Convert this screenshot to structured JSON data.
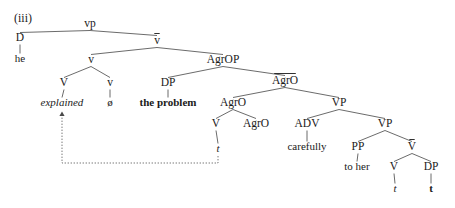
{
  "figure": {
    "example_number": "(iii)",
    "type": "syntax-tree",
    "sentence_reading": "he explained the problem carefully to her",
    "colors": {
      "text": "#1a1a1a",
      "branch": "#5a5a5a",
      "movement": "#6a6a6a",
      "background": "#ffffff"
    }
  },
  "nodes": [
    {
      "id": "vp",
      "label": "vp",
      "x": 90,
      "y": 27,
      "style": "plain",
      "bar": false
    },
    {
      "id": "D",
      "label": "D",
      "x": 20,
      "y": 41,
      "style": "plain",
      "bar": false
    },
    {
      "id": "he",
      "label": "he",
      "x": 20,
      "y": 62,
      "style": "plain",
      "bar": false,
      "terminal": true
    },
    {
      "id": "vbar",
      "label": "v",
      "x": 157,
      "y": 44,
      "style": "plain",
      "bar": true
    },
    {
      "id": "v2",
      "label": "v",
      "x": 91,
      "y": 63,
      "style": "plain",
      "bar": false
    },
    {
      "id": "V1",
      "label": "V",
      "x": 64,
      "y": 86,
      "style": "plain",
      "bar": false
    },
    {
      "id": "explained",
      "label": "explained",
      "x": 62,
      "y": 106,
      "style": "italic",
      "bar": false,
      "terminal": true
    },
    {
      "id": "v3",
      "label": "v",
      "x": 110,
      "y": 86,
      "style": "plain",
      "bar": false
    },
    {
      "id": "null",
      "label": "ø",
      "x": 110,
      "y": 106,
      "style": "plain",
      "bar": false,
      "terminal": true
    },
    {
      "id": "AgrOP",
      "label": "AgrOP",
      "x": 223,
      "y": 63,
      "style": "plain",
      "bar": false
    },
    {
      "id": "DP1",
      "label": "DP",
      "x": 168,
      "y": 86,
      "style": "plain",
      "bar": false
    },
    {
      "id": "problem",
      "label": "the problem",
      "x": 168,
      "y": 106,
      "style": "bold",
      "bar": false,
      "terminal": true
    },
    {
      "id": "AgrObar",
      "label": "AgrO",
      "x": 285,
      "y": 84,
      "style": "plain",
      "bar": true
    },
    {
      "id": "AgrO2",
      "label": "AgrO",
      "x": 233,
      "y": 106,
      "style": "plain",
      "bar": false
    },
    {
      "id": "V2",
      "label": "V",
      "x": 216,
      "y": 127,
      "style": "plain",
      "bar": false
    },
    {
      "id": "t1",
      "label": "t",
      "x": 218,
      "y": 152,
      "style": "italic",
      "bar": false,
      "terminal": true
    },
    {
      "id": "AgrO3",
      "label": "AgrO",
      "x": 256,
      "y": 127,
      "style": "plain",
      "bar": false
    },
    {
      "id": "VP1",
      "label": "VP",
      "x": 339,
      "y": 106,
      "style": "plain",
      "bar": false
    },
    {
      "id": "ADV",
      "label": "ADV",
      "x": 307,
      "y": 127,
      "style": "plain",
      "bar": false
    },
    {
      "id": "carefully",
      "label": "carefully",
      "x": 307,
      "y": 150,
      "style": "plain",
      "bar": false,
      "terminal": true
    },
    {
      "id": "VP2",
      "label": "VP",
      "x": 385,
      "y": 127,
      "style": "plain",
      "bar": false
    },
    {
      "id": "PP",
      "label": "PP",
      "x": 358,
      "y": 150,
      "style": "plain",
      "bar": false
    },
    {
      "id": "toher",
      "label": "to her",
      "x": 357,
      "y": 170,
      "style": "plain",
      "bar": false,
      "terminal": true
    },
    {
      "id": "Vbar2",
      "label": "V",
      "x": 412,
      "y": 150,
      "style": "plain",
      "bar": true
    },
    {
      "id": "V3",
      "label": "V",
      "x": 394,
      "y": 170,
      "style": "plain",
      "bar": false
    },
    {
      "id": "t2",
      "label": "t",
      "x": 395,
      "y": 192,
      "style": "italic",
      "bar": false,
      "terminal": true
    },
    {
      "id": "DP2",
      "label": "DP",
      "x": 431,
      "y": 170,
      "style": "plain",
      "bar": false
    },
    {
      "id": "t3",
      "label": "t",
      "x": 431,
      "y": 192,
      "style": "bold",
      "bar": false,
      "terminal": true
    }
  ],
  "edges": [
    {
      "from": "vp",
      "to": "D"
    },
    {
      "from": "vp",
      "to": "vbar"
    },
    {
      "from": "D",
      "to": "he"
    },
    {
      "from": "vbar",
      "to": "v2"
    },
    {
      "from": "vbar",
      "to": "AgrOP"
    },
    {
      "from": "v2",
      "to": "V1"
    },
    {
      "from": "v2",
      "to": "v3"
    },
    {
      "from": "V1",
      "to": "explained"
    },
    {
      "from": "v3",
      "to": "null"
    },
    {
      "from": "AgrOP",
      "to": "DP1"
    },
    {
      "from": "AgrOP",
      "to": "AgrObar"
    },
    {
      "from": "DP1",
      "to": "problem"
    },
    {
      "from": "AgrObar",
      "to": "AgrO2"
    },
    {
      "from": "AgrObar",
      "to": "VP1"
    },
    {
      "from": "AgrO2",
      "to": "V2"
    },
    {
      "from": "AgrO2",
      "to": "AgrO3"
    },
    {
      "from": "V2",
      "to": "t1"
    },
    {
      "from": "VP1",
      "to": "ADV"
    },
    {
      "from": "VP1",
      "to": "VP2"
    },
    {
      "from": "ADV",
      "to": "carefully"
    },
    {
      "from": "VP2",
      "to": "PP"
    },
    {
      "from": "VP2",
      "to": "Vbar2"
    },
    {
      "from": "PP",
      "to": "toher"
    },
    {
      "from": "Vbar2",
      "to": "V3"
    },
    {
      "from": "Vbar2",
      "to": "DP2"
    },
    {
      "from": "V3",
      "to": "t2"
    },
    {
      "from": "DP2",
      "to": "t3"
    }
  ],
  "movement": {
    "label": "head-movement-trace",
    "from_node": "t1",
    "to_node": "explained",
    "path": "M 218 156 L 218 163 L 62 163 L 62 113"
  }
}
